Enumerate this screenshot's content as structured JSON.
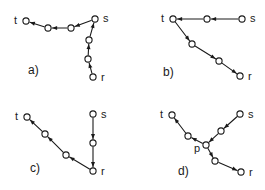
{
  "figure": {
    "background_color": "#ffffff",
    "ink_color": "#1a1a1a",
    "width": 265,
    "height": 190
  },
  "panels": [
    {
      "id": "a",
      "label": "a)",
      "label_pos": {
        "x": 28,
        "y": 74
      },
      "description": "Path from s leftward to t, and separate chain from r upward to s",
      "terminals": [
        {
          "name": "t",
          "label": "t",
          "x": 26,
          "y": 21,
          "label_pos": {
            "x": 14,
            "y": 24
          }
        },
        {
          "name": "s",
          "label": "s",
          "x": 95,
          "y": 19,
          "label_pos": {
            "x": 103,
            "y": 22
          }
        },
        {
          "name": "r",
          "label": "r",
          "x": 93,
          "y": 77,
          "label_pos": {
            "x": 101,
            "y": 81
          }
        }
      ],
      "intermediate_nodes": [
        {
          "x": 48,
          "y": 28
        },
        {
          "x": 71,
          "y": 28
        },
        {
          "x": 89,
          "y": 40
        },
        {
          "x": 88,
          "y": 59
        }
      ],
      "edges": [
        {
          "from": "s",
          "to": "n2",
          "x1": 95,
          "y1": 19,
          "x2": 71,
          "y2": 28,
          "arrow_at": "end"
        },
        {
          "from": "n2",
          "to": "n1",
          "x1": 71,
          "y1": 28,
          "x2": 48,
          "y2": 28,
          "arrow_at": "end"
        },
        {
          "from": "n1",
          "to": "t",
          "x1": 48,
          "y1": 28,
          "x2": 26,
          "y2": 21,
          "arrow_at": "end"
        },
        {
          "from": "r",
          "to": "n4",
          "x1": 93,
          "y1": 77,
          "x2": 88,
          "y2": 59,
          "arrow_at": "end"
        },
        {
          "from": "n4",
          "to": "n3",
          "x1": 88,
          "y1": 59,
          "x2": 89,
          "y2": 40,
          "arrow_at": "end"
        },
        {
          "from": "n3",
          "to": "s",
          "x1": 89,
          "y1": 40,
          "x2": 95,
          "y2": 19,
          "arrow_at": "end"
        }
      ]
    },
    {
      "id": "b",
      "label": "b)",
      "label_pos": {
        "x": 163,
        "y": 76
      },
      "description": "Straight horizontal path from s to t, then diagonal path from t down to r",
      "terminals": [
        {
          "name": "t",
          "label": "t",
          "x": 173,
          "y": 19,
          "label_pos": {
            "x": 161,
            "y": 22
          }
        },
        {
          "name": "s",
          "label": "s",
          "x": 242,
          "y": 19,
          "label_pos": {
            "x": 250,
            "y": 22
          }
        },
        {
          "name": "r",
          "label": "r",
          "x": 240,
          "y": 76,
          "label_pos": {
            "x": 248,
            "y": 80
          }
        }
      ],
      "intermediate_nodes": [
        {
          "x": 207,
          "y": 19
        },
        {
          "x": 192,
          "y": 44
        },
        {
          "x": 219,
          "y": 61
        }
      ],
      "edges": [
        {
          "from": "s",
          "to": "n1",
          "x1": 242,
          "y1": 19,
          "x2": 207,
          "y2": 19,
          "arrow_at": "end"
        },
        {
          "from": "n1",
          "to": "t",
          "x1": 207,
          "y1": 19,
          "x2": 173,
          "y2": 19,
          "arrow_at": "end"
        },
        {
          "from": "t",
          "to": "n2",
          "x1": 173,
          "y1": 19,
          "x2": 192,
          "y2": 44,
          "arrow_at": "end"
        },
        {
          "from": "n2",
          "to": "n3",
          "x1": 192,
          "y1": 44,
          "x2": 219,
          "y2": 61,
          "arrow_at": "end"
        },
        {
          "from": "n3",
          "to": "r",
          "x1": 219,
          "y1": 61,
          "x2": 240,
          "y2": 76,
          "arrow_at": "end"
        }
      ]
    },
    {
      "id": "c",
      "label": "c)",
      "label_pos": {
        "x": 30,
        "y": 172
      },
      "description": "Straight vertical path from s down to r, then diagonal path from r up to t",
      "terminals": [
        {
          "name": "t",
          "label": "t",
          "x": 27,
          "y": 117,
          "label_pos": {
            "x": 15,
            "y": 120
          }
        },
        {
          "name": "s",
          "label": "s",
          "x": 93,
          "y": 114,
          "label_pos": {
            "x": 101,
            "y": 118
          }
        },
        {
          "name": "r",
          "label": "r",
          "x": 93,
          "y": 171,
          "label_pos": {
            "x": 101,
            "y": 175
          }
        }
      ],
      "intermediate_nodes": [
        {
          "x": 93,
          "y": 143
        },
        {
          "x": 66,
          "y": 155
        },
        {
          "x": 45,
          "y": 134
        }
      ],
      "edges": [
        {
          "from": "s",
          "to": "n1",
          "x1": 93,
          "y1": 114,
          "x2": 93,
          "y2": 143,
          "arrow_at": "end"
        },
        {
          "from": "n1",
          "to": "r",
          "x1": 93,
          "y1": 143,
          "x2": 93,
          "y2": 171,
          "arrow_at": "end"
        },
        {
          "from": "r",
          "to": "n2",
          "x1": 93,
          "y1": 171,
          "x2": 66,
          "y2": 155,
          "arrow_at": "end"
        },
        {
          "from": "n2",
          "to": "n3",
          "x1": 66,
          "y1": 155,
          "x2": 45,
          "y2": 134,
          "arrow_at": "end"
        },
        {
          "from": "n3",
          "to": "t",
          "x1": 45,
          "y1": 134,
          "x2": 27,
          "y2": 117,
          "arrow_at": "end"
        }
      ]
    },
    {
      "id": "d",
      "label": "d)",
      "label_pos": {
        "x": 178,
        "y": 175
      },
      "description": "Branching tree: path from s into junction node p, then branches from p out to t and out to r",
      "terminals": [
        {
          "name": "t",
          "label": "t",
          "x": 172,
          "y": 115,
          "label_pos": {
            "x": 160,
            "y": 118
          }
        },
        {
          "name": "s",
          "label": "s",
          "x": 240,
          "y": 114,
          "label_pos": {
            "x": 248,
            "y": 118
          }
        },
        {
          "name": "r",
          "label": "r",
          "x": 241,
          "y": 172,
          "label_pos": {
            "x": 249,
            "y": 176
          }
        }
      ],
      "junction": {
        "name": "p",
        "label": "p",
        "x": 206,
        "y": 145,
        "label_pos": {
          "x": 194,
          "y": 152
        }
      },
      "intermediate_nodes": [
        {
          "x": 221,
          "y": 131
        },
        {
          "x": 188,
          "y": 136
        },
        {
          "x": 215,
          "y": 161
        }
      ],
      "edges": [
        {
          "from": "s",
          "to": "n1",
          "x1": 240,
          "y1": 114,
          "x2": 221,
          "y2": 131,
          "arrow_at": "end"
        },
        {
          "from": "n1",
          "to": "p",
          "x1": 221,
          "y1": 131,
          "x2": 206,
          "y2": 145,
          "arrow_at": "end"
        },
        {
          "from": "p",
          "to": "n2",
          "x1": 206,
          "y1": 145,
          "x2": 188,
          "y2": 136,
          "arrow_at": "end"
        },
        {
          "from": "n2",
          "to": "t",
          "x1": 188,
          "y1": 136,
          "x2": 172,
          "y2": 115,
          "arrow_at": "end"
        },
        {
          "from": "p",
          "to": "n3",
          "x1": 206,
          "y1": 145,
          "x2": 215,
          "y2": 161,
          "arrow_at": "end"
        },
        {
          "from": "n3",
          "to": "r",
          "x1": 215,
          "y1": 161,
          "x2": 241,
          "y2": 172,
          "arrow_at": "end"
        }
      ]
    }
  ]
}
